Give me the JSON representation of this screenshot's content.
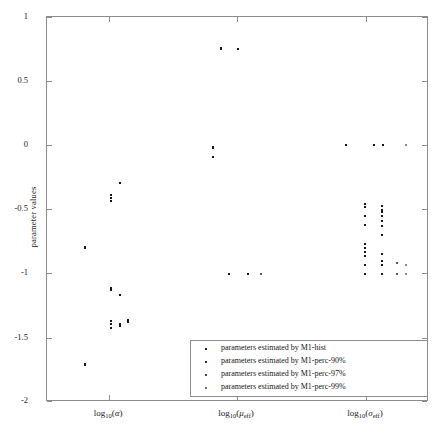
{
  "figure": {
    "background_color": "#ffffff",
    "axis_color": "#8c8c8c",
    "marker_color": "#161616"
  },
  "axes": {
    "ylabel": "parameter values",
    "ytick_labels": [
      "1",
      "0.5",
      "0",
      "-0.5",
      "-1",
      "-1.5",
      "-2"
    ],
    "ytick_values": [
      1,
      0.5,
      0,
      -0.5,
      -1,
      -1.5,
      -2
    ],
    "xtick_labels": [
      "log10(alpha)",
      "log10(mu_eff)",
      "log10(sigma_eff)"
    ],
    "xtick_positions": [
      1,
      2,
      3
    ]
  },
  "legend": {
    "entries": [
      {
        "marker": "dot",
        "label": "parameters estimated by M1-hist"
      },
      {
        "marker": "dot",
        "label": "parameters estimated by M1-perc-90%"
      },
      {
        "marker": "dot",
        "label": "parameters estimated by M1-perc-97%"
      },
      {
        "marker": "dot",
        "label": "parameters estimated by M1-perc-99%"
      }
    ]
  },
  "chart_data": {
    "type": "scatter",
    "title": "",
    "xlabel": "",
    "ylabel": "parameter values",
    "xlim": [
      0.5,
      3.5
    ],
    "ylim": [
      -2,
      1
    ],
    "grid": false,
    "legend_position": "lower right",
    "x_categories": [
      "log10(alpha)",
      "log10(mu_eff)",
      "log10(sigma_eff)"
    ],
    "series": [
      {
        "name": "parameters estimated by M1-hist",
        "points": [
          {
            "x": 0.8,
            "y": -0.79
          },
          {
            "x": 0.8,
            "y": -0.8
          },
          {
            "x": 0.8,
            "y": -1.7
          },
          {
            "x": 0.8,
            "y": -1.71
          },
          {
            "x": 1.0,
            "y": -0.39
          },
          {
            "x": 1.0,
            "y": -0.41
          },
          {
            "x": 1.0,
            "y": -0.43
          },
          {
            "x": 1.0,
            "y": -1.11
          },
          {
            "x": 1.0,
            "y": -1.13
          },
          {
            "x": 1.0,
            "y": -1.37
          },
          {
            "x": 1.0,
            "y": -1.39
          },
          {
            "x": 1.0,
            "y": -1.42
          },
          {
            "x": 1.87,
            "y": 0.75
          },
          {
            "x": 1.87,
            "y": 0.76
          },
          {
            "x": 1.8,
            "y": -0.01
          },
          {
            "x": 1.8,
            "y": -0.02
          },
          {
            "x": 1.8,
            "y": -0.09
          },
          {
            "x": 1.93,
            "y": -1.0
          },
          {
            "x": 2.85,
            "y": 0.0
          },
          {
            "x": 3.0,
            "y": -0.46
          },
          {
            "x": 3.0,
            "y": -0.48
          },
          {
            "x": 3.0,
            "y": -0.55
          },
          {
            "x": 3.0,
            "y": -0.62
          },
          {
            "x": 3.0,
            "y": -0.77
          },
          {
            "x": 3.0,
            "y": -0.8
          },
          {
            "x": 3.0,
            "y": -0.83
          },
          {
            "x": 3.0,
            "y": -0.86
          },
          {
            "x": 3.0,
            "y": -0.93
          },
          {
            "x": 3.0,
            "y": -1.0
          }
        ]
      },
      {
        "name": "parameters estimated by M1-perc-90%",
        "points": [
          {
            "x": 1.07,
            "y": -0.29
          },
          {
            "x": 1.07,
            "y": -1.17
          },
          {
            "x": 1.07,
            "y": -1.39
          },
          {
            "x": 1.07,
            "y": -1.41
          },
          {
            "x": 1.14,
            "y": -1.36
          },
          {
            "x": 1.14,
            "y": -1.38
          },
          {
            "x": 2.0,
            "y": 0.75
          },
          {
            "x": 2.08,
            "y": -1.0
          },
          {
            "x": 3.07,
            "y": 0.0
          },
          {
            "x": 3.14,
            "y": 0.0
          },
          {
            "x": 3.13,
            "y": -0.47
          },
          {
            "x": 3.13,
            "y": -0.5
          },
          {
            "x": 3.13,
            "y": -0.52
          },
          {
            "x": 3.13,
            "y": -0.55
          },
          {
            "x": 3.13,
            "y": -0.59
          },
          {
            "x": 3.13,
            "y": -0.63
          },
          {
            "x": 3.13,
            "y": -0.7
          },
          {
            "x": 3.13,
            "y": -0.85
          },
          {
            "x": 3.13,
            "y": -0.9
          },
          {
            "x": 3.13,
            "y": -0.93
          },
          {
            "x": 3.13,
            "y": -1.0
          }
        ]
      },
      {
        "name": "parameters estimated by M1-perc-97%",
        "points": [
          {
            "x": 2.18,
            "y": -1.0
          },
          {
            "x": 3.25,
            "y": -0.92
          },
          {
            "x": 3.25,
            "y": -1.0
          }
        ]
      },
      {
        "name": "parameters estimated by M1-perc-99%",
        "points": [
          {
            "x": 3.32,
            "y": 0.0
          },
          {
            "x": 3.32,
            "y": -0.93
          },
          {
            "x": 3.32,
            "y": -1.0
          }
        ]
      }
    ]
  }
}
